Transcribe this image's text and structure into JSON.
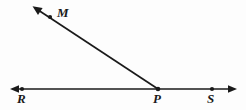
{
  "figure": {
    "kind": "geometry-diagram",
    "background_color": "#fdfdfd",
    "stroke_color": "#1a1a1a",
    "stroke_width": 1.6,
    "canvas": {
      "width": 246,
      "height": 110
    },
    "labels": {
      "R": "R",
      "P": "P",
      "S": "S",
      "M": "M"
    },
    "points": [
      {
        "name": "R",
        "label": "R",
        "x": 22,
        "y": 89,
        "dot": true
      },
      {
        "name": "P",
        "label": "P",
        "x": 158,
        "y": 89,
        "dot": true
      },
      {
        "name": "S",
        "label": "S",
        "x": 212,
        "y": 89,
        "dot": true
      },
      {
        "name": "M",
        "label": "M",
        "x": 50,
        "y": 17,
        "dot": true
      }
    ],
    "line_RS": {
      "name": "line-RS",
      "x1": 11,
      "y1": 89,
      "x2": 236,
      "y2": 89,
      "arrow_start": true,
      "arrow_end": true
    },
    "ray_PM": {
      "name": "ray-PM",
      "x1": 158,
      "y1": 89,
      "x2": 35,
      "y2": 8,
      "arrow_start": false,
      "arrow_end": true
    }
  }
}
